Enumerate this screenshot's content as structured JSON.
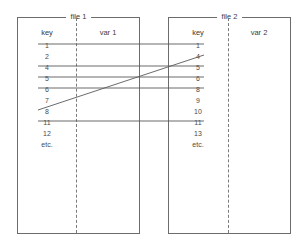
{
  "diagram": {
    "line_color": "#5a5a5a",
    "border_color": "#6c6c6c",
    "text_color": "#3a3a3a",
    "background": "#ffffff"
  },
  "files": [
    {
      "id": "file-1",
      "title": "file 1",
      "key_column_header": "key",
      "var_column_header": "var 1",
      "keys": [
        "1",
        "2",
        "4",
        "5",
        "6",
        "7",
        "8",
        "11",
        "12",
        "etc."
      ]
    },
    {
      "id": "file-2",
      "title": "file 2",
      "key_column_header": "key",
      "var_column_header": "var 2",
      "keys": [
        "1",
        "4",
        "5",
        "6",
        "8",
        "9",
        "10",
        "11",
        "13",
        "etc."
      ]
    }
  ],
  "matches": [
    {
      "left_key": "1",
      "right_key": "1",
      "left_row": 0,
      "right_row": 0
    },
    {
      "left_key": "4",
      "right_key": "5",
      "left_row": 2,
      "right_row": 2
    },
    {
      "left_key": "5",
      "right_key": "6",
      "left_row": 3,
      "right_row": 3
    },
    {
      "left_key": "6",
      "right_key": "8",
      "left_row": 4,
      "right_row": 4
    },
    {
      "left_key": "8",
      "right_key": "4",
      "left_row": 6,
      "right_row": 1
    },
    {
      "left_key": "11",
      "right_key": "11",
      "left_row": 7,
      "right_row": 7
    }
  ],
  "geometry": {
    "row_height": 11,
    "first_row_center_y": 44,
    "left_line_start_x": 38,
    "left_line_end_x": 139,
    "right_line_start_x": 168,
    "right_line_end_x": 204
  }
}
